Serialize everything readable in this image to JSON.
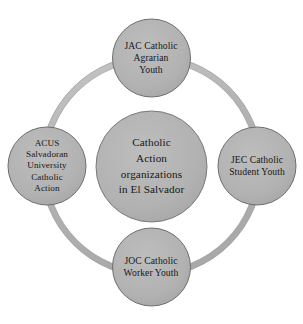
{
  "diagram": {
    "type": "cycle-hub-and-spoke",
    "background_color": "#ffffff",
    "shape_fill_color": "#b3b3b3",
    "shape_stroke_color": "#6e6e6e",
    "ring_fill_color": "#b8b8b8",
    "text_color": "#171717",
    "center": {
      "label": "Catholic\nAction\norganizations\nin El Salvador",
      "lines": [
        "Catholic",
        "Action",
        "organizations",
        "in El Salvador"
      ]
    },
    "nodes": [
      {
        "position": "top",
        "label": "JAC Catholic\nAgrarian\nYouth",
        "lines": [
          "JAC Catholic",
          "Agrarian",
          "Youth"
        ],
        "acronym": "JAC"
      },
      {
        "position": "right",
        "label": "JEC Catholic\nStudent Youth",
        "lines": [
          "JEC Catholic",
          "Student Youth"
        ],
        "acronym": "JEC"
      },
      {
        "position": "bottom",
        "label": "JOC Catholic\nWorker Youth",
        "lines": [
          "JOC Catholic",
          "Worker Youth"
        ],
        "acronym": "JOC"
      },
      {
        "position": "left",
        "label": "ACUS\nSalvadoran\nUniversity\nCatholic\nAction",
        "lines": [
          "ACUS",
          "Salvadoran",
          "University",
          "Catholic",
          "Action"
        ],
        "acronym": "ACUS"
      }
    ]
  }
}
